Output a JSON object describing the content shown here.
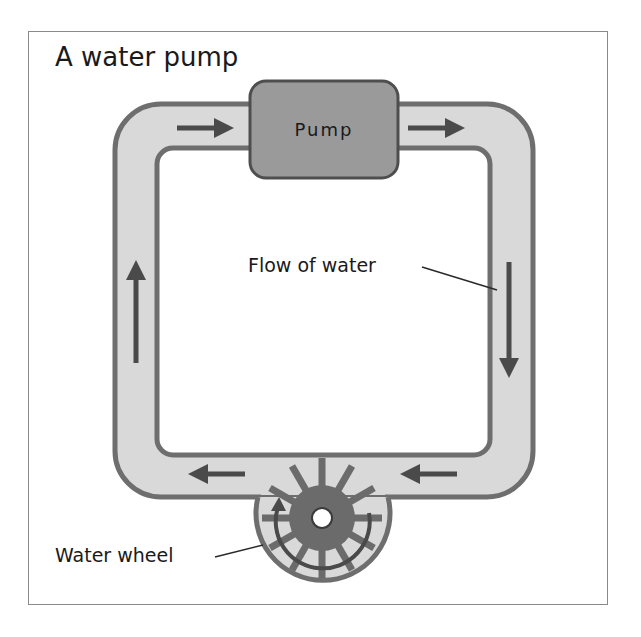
{
  "title": "A water pump",
  "labels": {
    "pump": "Pump",
    "flow": "Flow of water",
    "wheel": "Water wheel"
  },
  "colors": {
    "pipe_fill": "#d9d9d9",
    "pipe_stroke": "#6e6e6e",
    "pump_fill": "#9a9a9a",
    "pump_stroke": "#4e4e4e",
    "arrow": "#4a4a4a",
    "wheel_hub": "#6b6b6b",
    "frame": "#8a8a8a"
  },
  "flow_arrows": [
    {
      "position": "top-left",
      "direction": "right"
    },
    {
      "position": "top-right",
      "direction": "right"
    },
    {
      "position": "right",
      "direction": "down"
    },
    {
      "position": "bottom-right",
      "direction": "left"
    },
    {
      "position": "bottom-left",
      "direction": "left"
    },
    {
      "position": "left",
      "direction": "up"
    }
  ]
}
